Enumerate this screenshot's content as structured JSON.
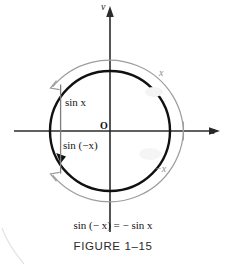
{
  "figure": {
    "axes": {
      "vertical_label": "v",
      "horizontal_label": "u",
      "origin_label": "O"
    },
    "arcs": [
      {
        "name": "positive-arc",
        "label": "x",
        "direction": "counterclockwise"
      },
      {
        "name": "negative-arc",
        "label": "−x",
        "direction": "clockwise"
      }
    ],
    "segments": [
      {
        "name": "sin-x-segment",
        "label": "sin x"
      },
      {
        "name": "sin-neg-x-segment",
        "label": "sin (−x)"
      }
    ],
    "equation": "sin (− x) = − sin x",
    "caption": "FIGURE 1–15",
    "colors": {
      "unit_circle": "#111111",
      "arc": "#9a9a9a",
      "axis": "#2b2b2b",
      "segment": "#7d7d7d",
      "background": "#ffffff",
      "text": "#141414"
    },
    "geometry": {
      "center_x": 110,
      "center_y": 131,
      "circle_radius": 60,
      "arc_radius": 74
    }
  }
}
